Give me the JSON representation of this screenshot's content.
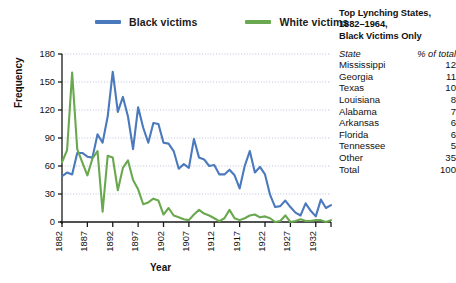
{
  "legend": {
    "items": [
      {
        "label": "Black victims",
        "color": "#4a79bd",
        "name": "legend-black-victims"
      },
      {
        "label": "White victims",
        "color": "#6aa84f",
        "name": "legend-white-victims"
      }
    ]
  },
  "side_table": {
    "title_lines": [
      "Top Lynching States,",
      "1882–1964,",
      "Black Victims Only"
    ],
    "header": {
      "state": "State",
      "pct": "% of total"
    },
    "rows": [
      {
        "state": "Mississippi",
        "pct": "12"
      },
      {
        "state": "Georgia",
        "pct": "11"
      },
      {
        "state": "Texas",
        "pct": "10"
      },
      {
        "state": "Louisiana",
        "pct": "8"
      },
      {
        "state": "Alabama",
        "pct": "7"
      },
      {
        "state": "Arkansas",
        "pct": "6"
      },
      {
        "state": "Florida",
        "pct": "6"
      },
      {
        "state": "Tennessee",
        "pct": "5"
      },
      {
        "state": "Other",
        "pct": "35"
      },
      {
        "state": "Total",
        "pct": "100"
      }
    ]
  },
  "axes": {
    "ylabel": "Frequency",
    "xlabel": "Year"
  },
  "chart_data": {
    "type": "line",
    "title": "",
    "xlabel": "Year",
    "ylabel": "Frequency",
    "xlim": [
      1882,
      1935
    ],
    "ylim": [
      0,
      180
    ],
    "yticks": [
      0,
      30,
      60,
      90,
      120,
      150,
      180
    ],
    "xticks": [
      1882,
      1887,
      1892,
      1897,
      1902,
      1907,
      1912,
      1917,
      1922,
      1927,
      1932
    ],
    "grid": true,
    "legend_position": "top",
    "x": [
      1882,
      1883,
      1884,
      1885,
      1886,
      1887,
      1888,
      1889,
      1890,
      1891,
      1892,
      1893,
      1894,
      1895,
      1896,
      1897,
      1898,
      1899,
      1900,
      1901,
      1902,
      1903,
      1904,
      1905,
      1906,
      1907,
      1908,
      1909,
      1910,
      1911,
      1912,
      1913,
      1914,
      1915,
      1916,
      1917,
      1918,
      1919,
      1920,
      1921,
      1922,
      1923,
      1924,
      1925,
      1926,
      1927,
      1928,
      1929,
      1930,
      1931,
      1932,
      1933,
      1934,
      1935
    ],
    "series": [
      {
        "name": "Black victims",
        "color": "#4a79bd",
        "values": [
          49,
          53,
          51,
          74,
          74,
          70,
          69,
          94,
          85,
          113,
          161,
          118,
          134,
          113,
          78,
          123,
          101,
          85,
          106,
          105,
          85,
          84,
          76,
          57,
          62,
          58,
          89,
          69,
          67,
          60,
          61,
          51,
          51,
          56,
          50,
          36,
          60,
          76,
          53,
          59,
          51,
          29,
          16,
          17,
          23,
          16,
          10,
          7,
          20,
          12,
          6,
          24,
          15,
          18
        ]
      },
      {
        "name": "White victims",
        "color": "#6aa84f",
        "values": [
          64,
          77,
          160,
          78,
          64,
          50,
          68,
          76,
          11,
          71,
          69,
          34,
          58,
          66,
          45,
          35,
          19,
          21,
          25,
          23,
          8,
          15,
          7,
          5,
          3,
          2,
          8,
          13,
          9,
          7,
          4,
          1,
          4,
          13,
          4,
          2,
          4,
          7,
          8,
          5,
          6,
          4,
          0,
          1,
          7,
          0,
          1,
          3,
          1,
          1,
          2,
          2,
          0,
          2
        ]
      }
    ]
  }
}
